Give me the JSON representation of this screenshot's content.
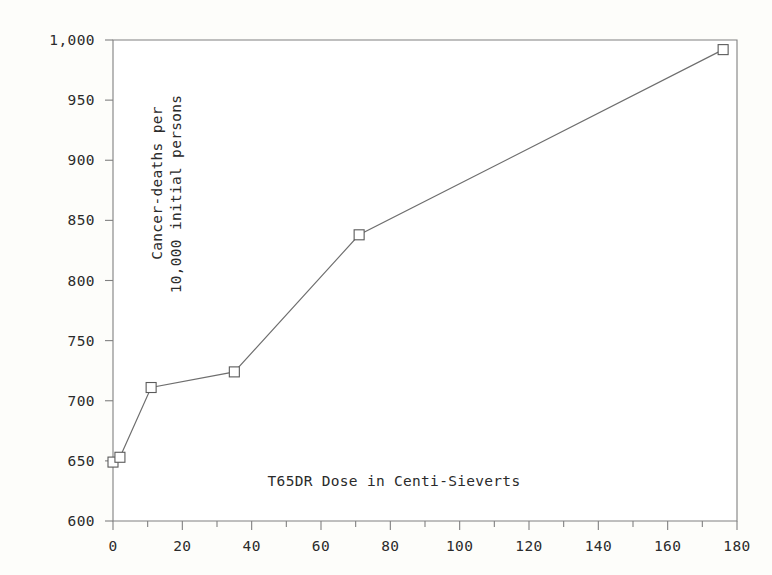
{
  "chart_data": {
    "type": "line",
    "title": "",
    "subtitle": "",
    "xlabel": "T65DR Dose in Centi-Sieverts",
    "ylabel_line1": "Cancer-deaths per",
    "ylabel_line2": "10,000 initial persons",
    "ylabel": "Cancer-deaths per 10,000 initial persons",
    "x": [
      0,
      2,
      11,
      35,
      71,
      176
    ],
    "values": [
      649,
      653,
      711,
      724,
      838,
      992
    ],
    "series": [
      {
        "name": "Cancer-deaths per 10,000 initial persons",
        "x": [
          0,
          2,
          11,
          35,
          71,
          176
        ],
        "values": [
          649,
          653,
          711,
          724,
          838,
          992
        ]
      }
    ],
    "points": [
      {
        "x": 0,
        "y": 649
      },
      {
        "x": 2,
        "y": 653
      },
      {
        "x": 11,
        "y": 711
      },
      {
        "x": 35,
        "y": 724
      },
      {
        "x": 71,
        "y": 838
      },
      {
        "x": 176,
        "y": 992
      }
    ],
    "xlim": [
      0,
      180
    ],
    "ylim": [
      600,
      1000
    ],
    "xticks": [
      0,
      20,
      40,
      60,
      80,
      100,
      120,
      140,
      160,
      180
    ],
    "xtick_labels": [
      "0",
      "20",
      "40",
      "60",
      "80",
      "100",
      "120",
      "140",
      "160",
      "180"
    ],
    "xticks_minor": [
      10,
      30,
      50,
      70,
      90,
      110,
      130,
      150,
      170
    ],
    "yticks": [
      600,
      650,
      700,
      750,
      800,
      850,
      900,
      950,
      1000
    ],
    "ytick_labels": [
      "600",
      "650",
      "700",
      "750",
      "800",
      "850",
      "900",
      "950",
      "1,000"
    ],
    "grid": false,
    "legend": null,
    "legend_position": "none",
    "marker": "square",
    "colors": {
      "line": "#6e6e6e",
      "marker_fill": "#ffffff",
      "marker_stroke": "#5a5a5a",
      "axis": "#808080",
      "text": "#2b2b2b",
      "plot_background": "#ffffff",
      "page_background": "#fdfdfa"
    }
  }
}
